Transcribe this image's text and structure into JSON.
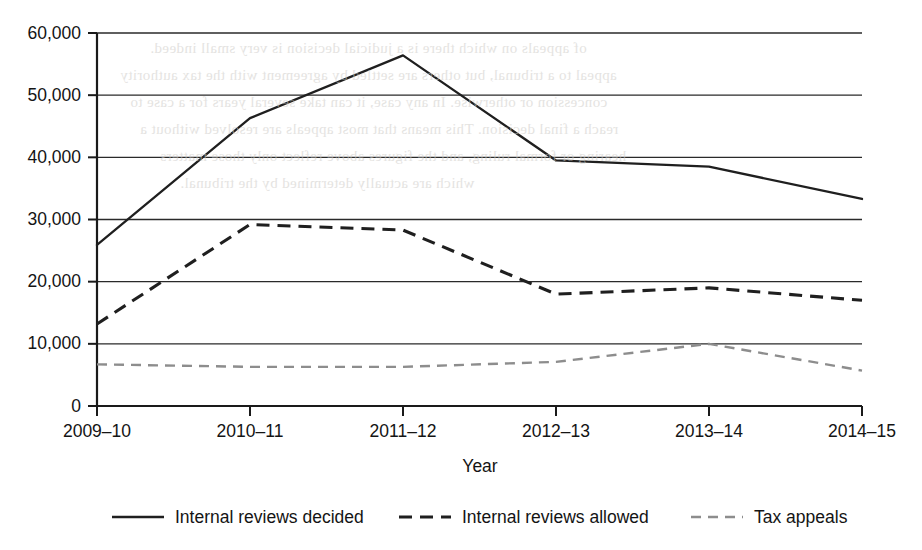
{
  "chart_data": {
    "type": "line",
    "title": "",
    "subtitle": "",
    "xlabel": "Year",
    "ylabel": "",
    "categories": [
      "2009–10",
      "2010–11",
      "2011–12",
      "2012–13",
      "2013–14",
      "2014–15"
    ],
    "series": [
      {
        "name": "Internal reviews decided",
        "style": "solid",
        "color": "#1f1f1f",
        "values": [
          25900,
          46300,
          56400,
          39500,
          38500,
          33300
        ]
      },
      {
        "name": "Internal reviews allowed",
        "style": "dashed",
        "color": "#1f1f1f",
        "values": [
          13200,
          29200,
          28300,
          18000,
          19000,
          17000
        ]
      },
      {
        "name": "Tax appeals",
        "style": "light-dashed",
        "color": "#8d8d8d",
        "values": [
          6700,
          6300,
          6300,
          7100,
          10000,
          5700
        ]
      }
    ],
    "ylim": [
      0,
      60000
    ],
    "ytick_values": [
      0,
      10000,
      20000,
      30000,
      40000,
      50000,
      60000
    ],
    "ytick_labels": [
      "0",
      "10,000",
      "20,000",
      "30,000",
      "40,000",
      "50,000",
      "60,000"
    ],
    "grid": true,
    "grid_axis": "y",
    "legend_position": "bottom"
  },
  "axes": {
    "x_title": "Year"
  },
  "legend": {
    "items": [
      {
        "label": "Internal reviews decided",
        "style": "solid"
      },
      {
        "label": "Internal reviews allowed",
        "style": "dashed"
      },
      {
        "label": "Tax appeals",
        "style": "light-dashed"
      }
    ]
  },
  "background_bleed": {
    "lines": [
      "of appeals on which there is a judicial decision is very small indeed.",
      "appeal to a tribunal, but others are settled by agreement with the tax authority",
      "concession or otherwise. In any case, it can take several years for a case to",
      "reach a final decision. This means that most appeals are resolved without a",
      "hearing or formal ruling, and the figures above reflect only those matters",
      "which are actually determined by the tribunal."
    ]
  }
}
